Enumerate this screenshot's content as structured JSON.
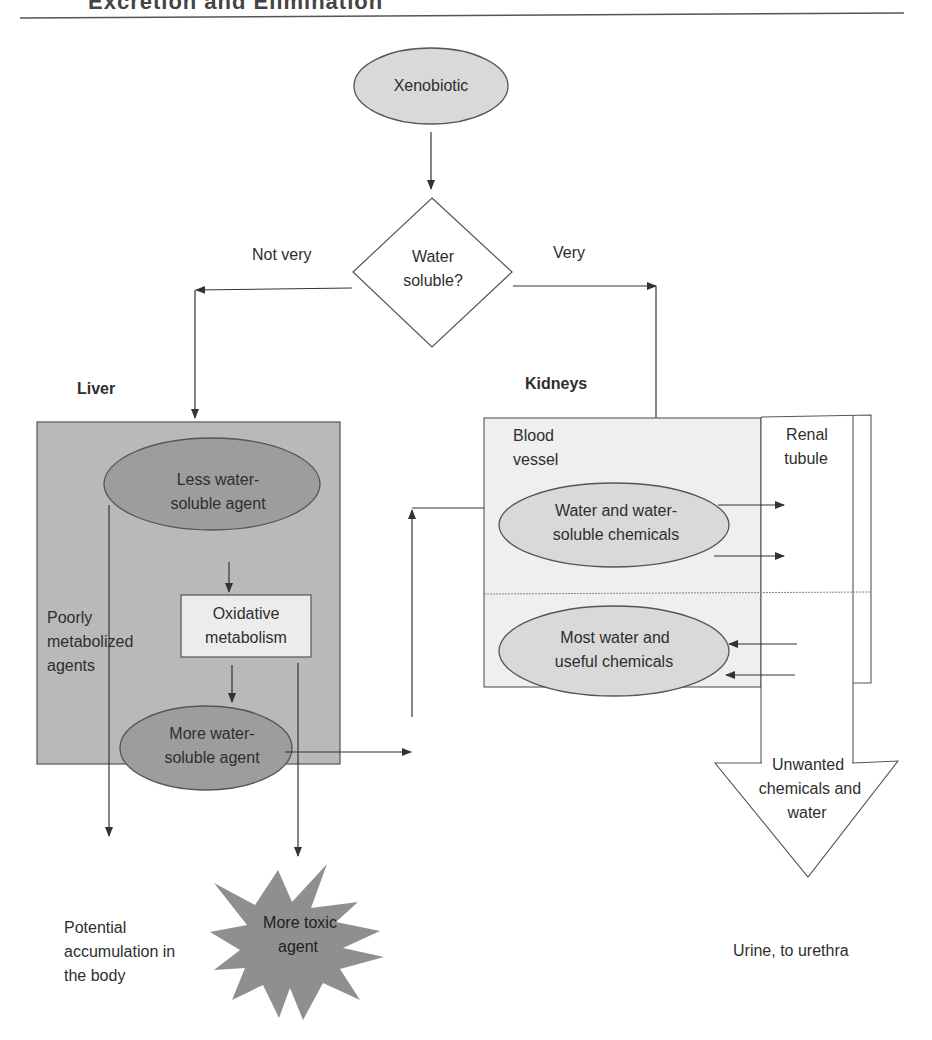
{
  "header": {
    "title": "Excretion and Elimination"
  },
  "colors": {
    "liver_box": "#b9b9b9",
    "dark_ellipse": "#9d9d9d",
    "light_ellipse": "#d9d9d9",
    "kidney_box": "#efefef",
    "oxidative_box": "#ececec",
    "star": "#8f8f8f",
    "line": "#333333"
  },
  "nodes": {
    "xenobiotic": "Xenobiotic",
    "decision": {
      "line1": "Water",
      "line2": "soluble?"
    },
    "branch_left": "Not very",
    "branch_right": "Very",
    "liver_title": "Liver",
    "kidneys_title": "Kidneys",
    "less_soluble": {
      "line1": "Less water-",
      "line2": "soluble agent"
    },
    "oxidative": {
      "line1": "Oxidative",
      "line2": "metabolism"
    },
    "poorly": {
      "line1": "Poorly",
      "line2": "metabolized",
      "line3": "agents"
    },
    "more_soluble": {
      "line1": "More water-",
      "line2": "soluble agent"
    },
    "more_toxic": {
      "line1": "More toxic",
      "line2": "agent"
    },
    "accumulation": {
      "line1": "Potential",
      "line2": "accumulation in",
      "line3": "the body"
    },
    "blood_vessel": {
      "line1": "Blood",
      "line2": "vessel"
    },
    "renal_tubule": {
      "line1": "Renal",
      "line2": "tubule"
    },
    "water_chemicals": {
      "line1": "Water and water-",
      "line2": "soluble chemicals"
    },
    "most_water": {
      "line1": "Most water and",
      "line2": "useful chemicals"
    },
    "unwanted": {
      "line1": "Unwanted",
      "line2": "chemicals and",
      "line3": "water"
    },
    "urine": "Urine, to urethra"
  }
}
